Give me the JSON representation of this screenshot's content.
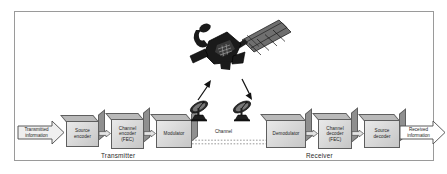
{
  "diagram": {
    "frame": {
      "border_color": "#9a9a9a",
      "background": "#ffffff"
    },
    "input_arrow": {
      "label": "Transmitted\ninformation",
      "name": "transmitted-information"
    },
    "output_arrow": {
      "label": "Received\ninformation",
      "name": "received-information"
    },
    "blocks": [
      {
        "id": "source-encoder",
        "label": "Source\nencoder"
      },
      {
        "id": "channel-encoder",
        "label": "Channel\nencoder\n(FEC)"
      },
      {
        "id": "modulator",
        "label": "Modulator"
      },
      {
        "id": "demodulator",
        "label": "Demodulator"
      },
      {
        "id": "channel-decoder",
        "label": "Channel\ndecoder\n(FEC)"
      },
      {
        "id": "source-decoder",
        "label": "Source\ndecoder"
      }
    ],
    "channel": {
      "label": "Channel"
    },
    "groups": [
      {
        "id": "transmitter",
        "label": "Transmitter"
      },
      {
        "id": "receiver",
        "label": "Receiver"
      }
    ],
    "space_segment": {
      "satellite": {
        "name": "satellite-icon"
      },
      "uplink": {
        "name": "uplink-arrow-icon"
      },
      "downlink": {
        "name": "downlink-arrow-icon"
      },
      "uplink_dish": {
        "name": "uplink-dish-icon"
      },
      "downlink_dish": {
        "name": "downlink-dish-icon"
      }
    },
    "colors": {
      "block_face_light": "#e9e9e9",
      "block_face_dark": "#c6c6c6",
      "block_outline": "#5e5e5e",
      "block_side": "#8f8f8f",
      "text": "#1d1d1d",
      "frame": "#9a9a9a"
    }
  }
}
